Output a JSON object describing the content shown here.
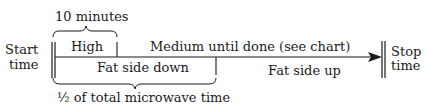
{
  "diagram": {
    "start_label_line1": "Start",
    "start_label_line2": "time",
    "stop_label_line1": "Stop",
    "stop_label_line2": "time",
    "top_brace_label": "10 minutes",
    "high_label": "High",
    "medium_label": "Medium until done (see chart)",
    "fat_down_label": "Fat side down",
    "fat_up_label": "Fat side up",
    "bottom_brace_label": "½ of total microwave time",
    "colors": {
      "ink": "#1a1a1a",
      "background": "#ffffff"
    }
  }
}
